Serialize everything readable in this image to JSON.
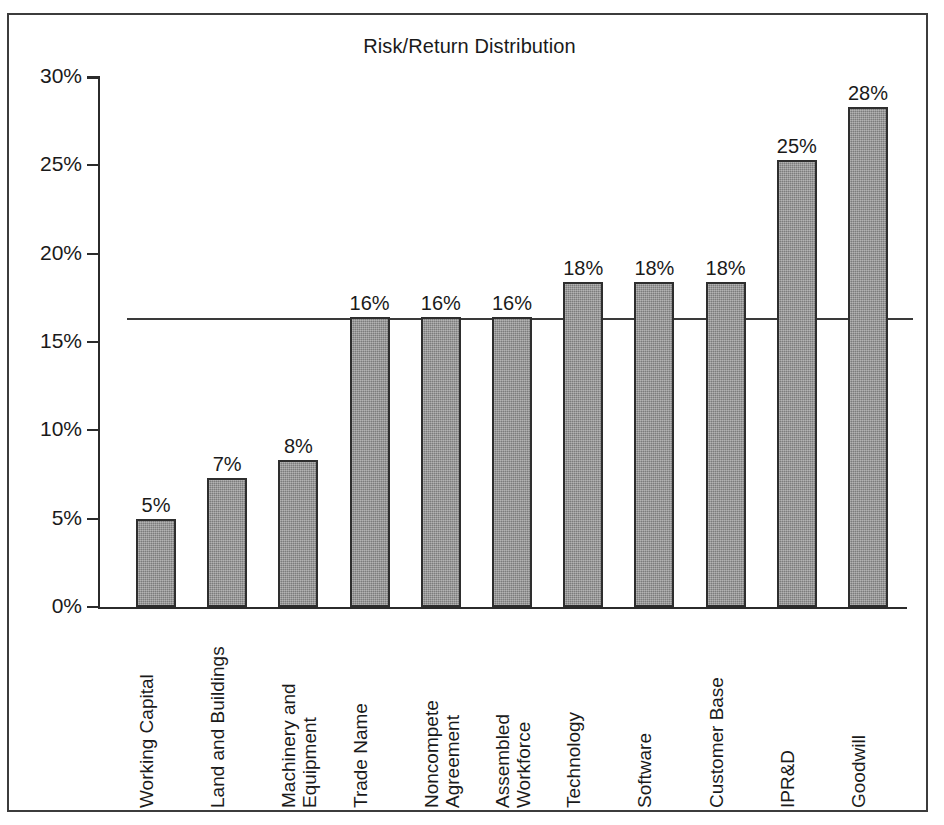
{
  "chart_data": {
    "type": "bar",
    "title": "Risk/Return Distribution",
    "xlabel": "",
    "ylabel": "",
    "ylim": [
      0,
      30
    ],
    "ytick_labels": [
      "0%",
      "5%",
      "10%",
      "15%",
      "20%",
      "25%",
      "30%"
    ],
    "ytick_values": [
      0,
      5,
      10,
      15,
      20,
      25,
      30
    ],
    "grid": false,
    "legend": "none",
    "orientation": "vertical",
    "bar_color": "#8b8b8b",
    "bar_edge_color": "#2e2e2e",
    "categories": [
      "Working Capital",
      "Land and Buildings",
      "Machinery and Equipment",
      "Trade Name",
      "Noncompete Agreement",
      "Assembled Workforce",
      "Technology",
      "Software",
      "Customer Base",
      "IPR&D",
      "Goodwill"
    ],
    "values": [
      5,
      7,
      8,
      16,
      16,
      16,
      18,
      18,
      18,
      25,
      28
    ],
    "data_labels": [
      "5%",
      "7%",
      "8%",
      "16%",
      "16%",
      "16%",
      "18%",
      "18%",
      "18%",
      "25%",
      "28%"
    ],
    "bar_heights_measured_pct": [
      5.0,
      7.3,
      8.3,
      16.4,
      16.4,
      16.4,
      18.4,
      18.4,
      18.4,
      25.3,
      28.3
    ],
    "annotations": [
      {
        "type": "reference-line",
        "orientation": "horizontal",
        "value": 16.3,
        "label": "",
        "color": "#3a3a3a",
        "spans_plot_width": true
      }
    ]
  },
  "figure": {
    "border_color": "#3c3c3c",
    "background": "#ffffff"
  }
}
